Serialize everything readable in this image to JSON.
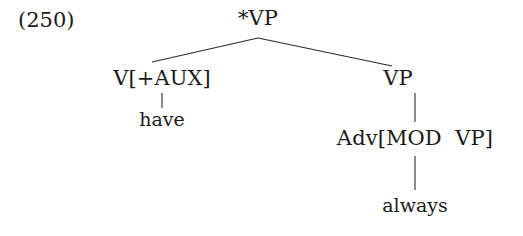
{
  "example": {
    "number": "(250)"
  },
  "tree": {
    "root": {
      "label": "*VP",
      "children": [
        {
          "label": "V[+AUX]",
          "children": [
            {
              "label": "have",
              "children": []
            }
          ]
        },
        {
          "label": "VP",
          "children": [
            {
              "label": "Adv[MOD  VP]",
              "children": [
                {
                  "label": "always",
                  "children": []
                }
              ]
            }
          ]
        }
      ]
    }
  },
  "labels": {
    "root": "*VP",
    "left_node": "V[+AUX]",
    "right_node": "VP",
    "left_leaf": "have",
    "right_mid": "Adv[MOD  VP]",
    "right_leaf": "always"
  },
  "style": {
    "ink_color": "#1a1a1a",
    "background": "#ffffff",
    "branch_color": "#2b2b2b"
  }
}
